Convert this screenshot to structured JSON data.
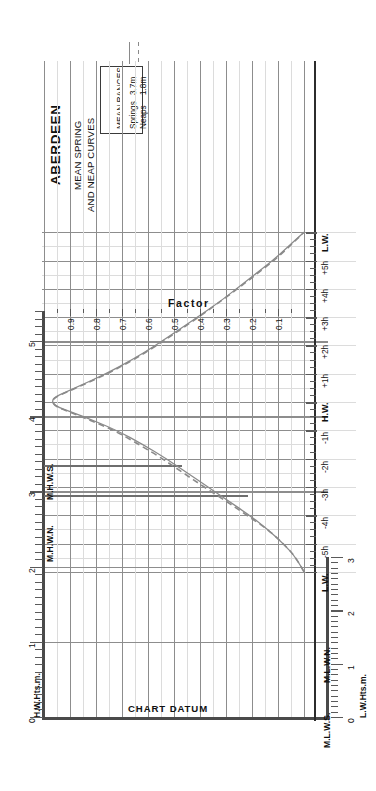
{
  "title": {
    "port": "ABERDEEN",
    "line1": "MEAN SPRING",
    "line2": "AND NEAP CURVES"
  },
  "legend": {
    "heading": "MEAN RANGES",
    "springs_label": "Springs",
    "springs_value": "3.7m",
    "neaps_label": "Neaps",
    "neaps_value": "1.8m",
    "springs_style": "solid",
    "neaps_style": "dashed"
  },
  "axes": {
    "left_title": "H.W.Hts.m.",
    "right_title": "L.W.Hts.m.",
    "factor_title": "Factor",
    "datum_label": "CHART DATUM"
  },
  "markers": {
    "mhws": "M.H.W.S.",
    "mhwn": "M.H.W.N.",
    "mlwn": "M.L.W.N.",
    "mlws": "M.L.W.S.",
    "hw": "H.W.",
    "lw_left": "L.W.",
    "lw_right": "L.W."
  },
  "left_axis_ticks": [
    "5",
    "4",
    "3",
    "2",
    "1",
    "0"
  ],
  "right_axis_ticks": [
    "3",
    "2",
    "1",
    "0"
  ],
  "factor_ticks": [
    "0.9",
    "0.8",
    "0.7",
    "0.6",
    "0.5",
    "0.4",
    "0.3",
    "0.2",
    "0.1"
  ],
  "time_ticks": [
    "L.W.",
    "-5",
    "-4",
    "-3",
    "-2",
    "-1",
    "H.W.",
    "+1",
    "+2",
    "+3",
    "+4",
    "+5",
    "L.W."
  ],
  "time_tick_sup": "h",
  "colors": {
    "curve": "#8a8a8a",
    "grid": "#c9c9c9",
    "grid_major": "#8d8d8d",
    "axis": "#4a4a4a",
    "text": "#111111"
  },
  "chart_data": {
    "type": "line",
    "title": "ABERDEEN MEAN SPRING AND NEAP CURVES",
    "xlabel": "Hours from High Water",
    "ylabel": "Factor / Height (m)",
    "xlim": [
      -6,
      6
    ],
    "ylim": [
      0,
      1
    ],
    "grid": true,
    "legend_position": "top-left",
    "axis_note": "Left vertical axis = H.W. heights 0-5.4m; right vertical axis = L.W. heights 0-3m; horizontal axis = Factor 0.1-0.9",
    "reference_levels": {
      "MHWS": 4.3,
      "MHWN": 3.4,
      "MLWN": 1.6,
      "MLWS": 0.6,
      "chart_datum": 0.0
    },
    "mean_ranges": {
      "springs_m": 3.7,
      "neaps_m": 1.8
    },
    "x": [
      -6,
      -5.5,
      -5,
      -4.5,
      -4,
      -3.5,
      -3,
      -2.5,
      -2,
      -1.5,
      -1,
      -0.5,
      0,
      0.5,
      1,
      1.5,
      2,
      2.5,
      3,
      3.5,
      4,
      4.5,
      5,
      5.5,
      6
    ],
    "series": [
      {
        "name": "Springs",
        "style": "solid",
        "values": [
          0.0,
          0.03,
          0.08,
          0.14,
          0.21,
          0.29,
          0.37,
          0.45,
          0.53,
          0.62,
          0.72,
          0.85,
          1.0,
          0.88,
          0.76,
          0.66,
          0.57,
          0.49,
          0.41,
          0.33,
          0.26,
          0.19,
          0.12,
          0.06,
          0.0
        ]
      },
      {
        "name": "Neaps",
        "style": "dashed",
        "values": [
          0.0,
          0.03,
          0.08,
          0.14,
          0.22,
          0.3,
          0.385,
          0.465,
          0.545,
          0.635,
          0.73,
          0.86,
          1.0,
          0.875,
          0.755,
          0.655,
          0.565,
          0.485,
          0.405,
          0.33,
          0.255,
          0.185,
          0.115,
          0.055,
          0.0
        ]
      }
    ]
  }
}
